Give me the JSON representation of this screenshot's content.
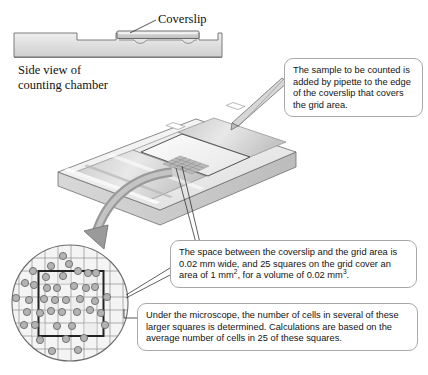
{
  "figure": {
    "side_view_label": "Side view of\ncounting chamber",
    "coverslip_label": "Coverslip"
  },
  "labels": {
    "coverslip": "Coverslip",
    "side_view_line1": "Side view of",
    "side_view_line2": "counting chamber"
  },
  "callouts": [
    {
      "id": "sample",
      "text": "The sample to be counted is added by pipette to the edge of the coverslip that covers the grid area."
    },
    {
      "id": "volume",
      "text_part1": "The space between the coverslip and the grid area is 0.02 mm wide, and 25 squares on the grid cover an area of 1 mm",
      "sup1": "2",
      "text_part2": ", for a volume of 0.02 mm",
      "sup2": "3",
      "text_part3": "."
    },
    {
      "id": "microscope",
      "text": "Under the microscope, the number of cells in several of these larger squares is determined. Calculations are based on the average number of cells in 25 of these squares."
    }
  ],
  "grid_view": {
    "grid_columns": 9,
    "grid_rows": 9,
    "highlighted_square_columns": 5,
    "highlighted_square_rows": 5,
    "cell_count_visible": 41
  },
  "colors": {
    "slide_light": "#f2f2f2",
    "slide_mid": "#d9d9d9",
    "slide_dark": "#b8b8b8",
    "outline": "#6e6e6e",
    "callout_border": "#a9a9a9",
    "arrow_gray": "#9a9a9a",
    "cell_fill": "#b3b3b3",
    "cell_stroke": "#6b6b6b",
    "grid_line": "#8c8c8c",
    "grid_bold": "#222222",
    "text": "#141414"
  }
}
